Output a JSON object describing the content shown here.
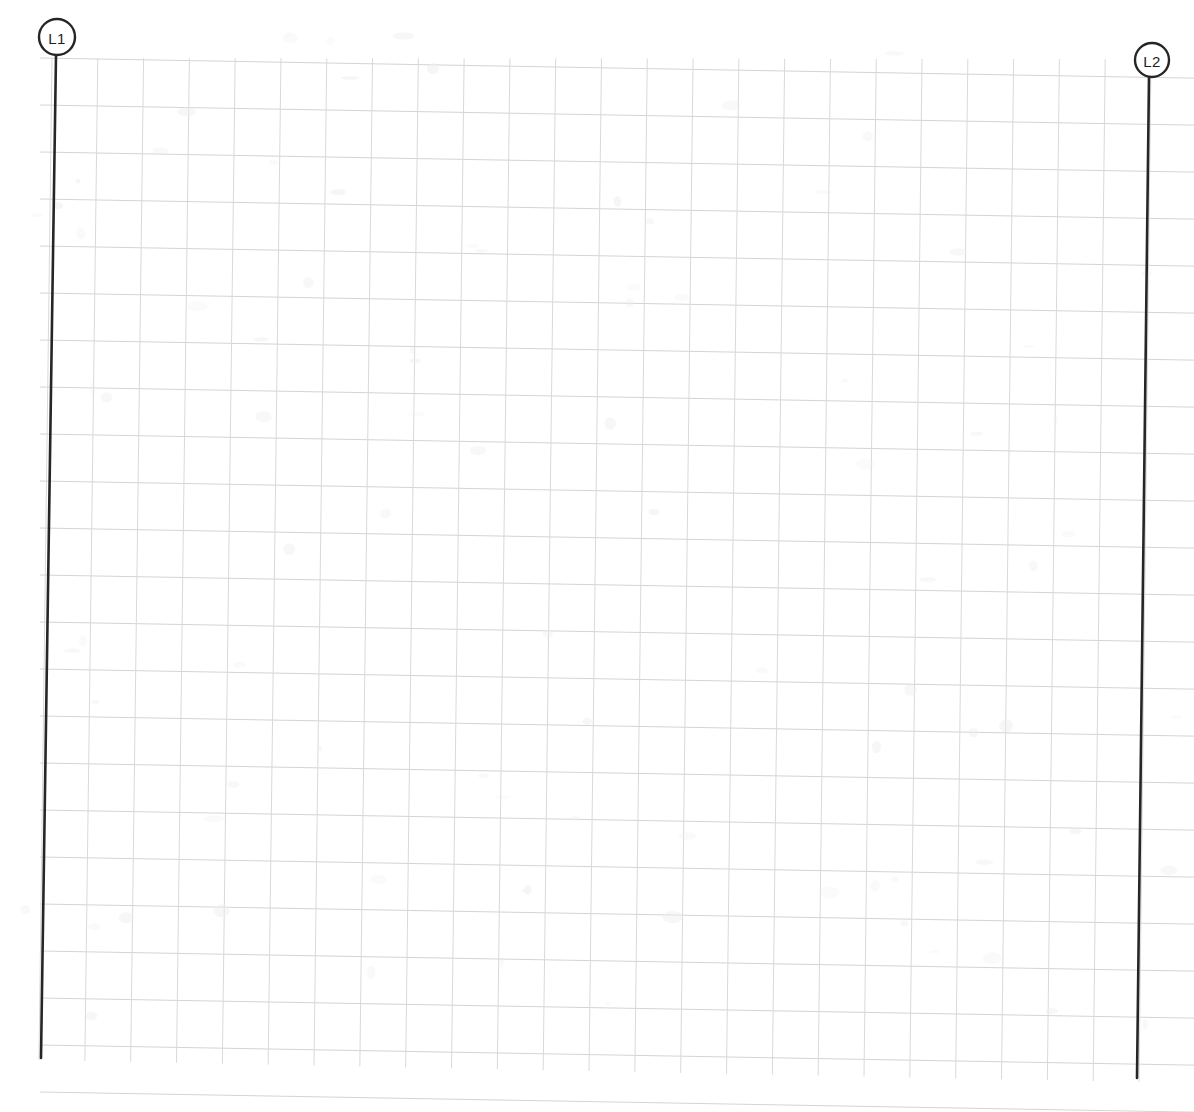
{
  "document": {
    "title": "Graph Paper Line Sketch",
    "background_color": "#ffffff",
    "width": 1194,
    "height": 1112
  },
  "grid": {
    "description": "Light gray graph paper ruling, slightly rotated",
    "color": "#d4d4d4",
    "cell_width": 44.6,
    "cell_height": 47.0,
    "columns": 24,
    "rows": 22,
    "origin_x": 52,
    "origin_y": 58,
    "skew_degrees": 1.0
  },
  "annotations": [
    {
      "id": "L1",
      "label": "L1",
      "marker": "circle-callout",
      "circle_cx": 57,
      "circle_cy": 37,
      "circle_r": 18,
      "line_x1": 56,
      "line_y1": 55,
      "line_x2": 41,
      "line_y2": 1058,
      "color": "#262626"
    },
    {
      "id": "L2",
      "label": "L2",
      "marker": "circle-callout",
      "circle_cx": 1152,
      "circle_cy": 60,
      "circle_r": 17,
      "line_x1": 1149,
      "line_y1": 77,
      "line_x2": 1137,
      "line_y2": 1078,
      "color": "#262626"
    }
  ],
  "legend": {
    "line_1_label": "L1",
    "line_2_label": "L2"
  }
}
